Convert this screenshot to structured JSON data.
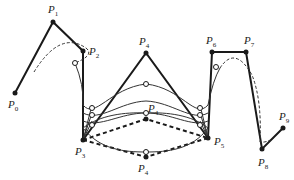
{
  "diagram": {
    "type": "spline-control-polygon",
    "colors": {
      "stroke": "#1a1a1a",
      "fill": "#ffffff"
    },
    "points": [
      {
        "name": "P",
        "sub": "0",
        "x": 15,
        "y": 93,
        "lx": 8,
        "ly": 108
      },
      {
        "name": "P",
        "sub": "1",
        "x": 53,
        "y": 22,
        "lx": 48,
        "ly": 13
      },
      {
        "name": "P",
        "sub": "2",
        "x": 83,
        "y": 51,
        "lx": 89,
        "ly": 55
      },
      {
        "name": "P",
        "sub": "3",
        "x": 83,
        "y": 140,
        "lx": 75,
        "ly": 155
      },
      {
        "name": "P",
        "sub": "4",
        "x": 146,
        "y": 53,
        "lx": 139,
        "ly": 45
      },
      {
        "name": "P",
        "sub": "4",
        "x": 146,
        "y": 119,
        "lx": 148,
        "ly": 112
      },
      {
        "name": "P",
        "sub": "4",
        "x": 146,
        "y": 157,
        "lx": 138,
        "ly": 172
      },
      {
        "name": "P",
        "sub": "5",
        "x": 208,
        "y": 138,
        "lx": 214,
        "ly": 145
      },
      {
        "name": "P",
        "sub": "6",
        "x": 212,
        "y": 52,
        "lx": 206,
        "ly": 44
      },
      {
        "name": "P",
        "sub": "7",
        "x": 246,
        "y": 52,
        "lx": 244,
        "ly": 44
      },
      {
        "name": "P",
        "sub": "8",
        "x": 262,
        "y": 149,
        "lx": 258,
        "ly": 166
      },
      {
        "name": "P",
        "sub": "9",
        "x": 283,
        "y": 128,
        "lx": 279,
        "ly": 120
      }
    ]
  }
}
